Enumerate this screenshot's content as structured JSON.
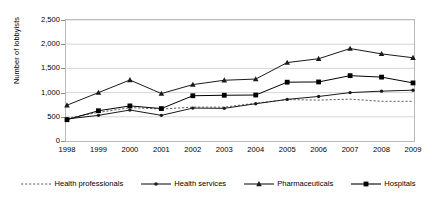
{
  "chart_data": {
    "type": "line",
    "title": "",
    "xlabel": "",
    "ylabel": "Number of lobbyists",
    "categories": [
      "1998",
      "1999",
      "2000",
      "2001",
      "2002",
      "2003",
      "2004",
      "2005",
      "2006",
      "2007",
      "2008",
      "2009"
    ],
    "ylim": [
      0,
      2500
    ],
    "yticks": [
      0,
      500,
      1000,
      1500,
      2000,
      2500
    ],
    "ytick_labels": [
      "0",
      "500",
      "1,000",
      "1,500",
      "2,000",
      "2,500"
    ],
    "grid": true,
    "grid_axis": "y",
    "legend_position": "bottom",
    "series": [
      {
        "name": "Health professionals",
        "marker": "none",
        "dash": true,
        "color": "#4d4d4d",
        "values": [
          470,
          590,
          690,
          660,
          700,
          700,
          780,
          855,
          845,
          865,
          820,
          820
        ]
      },
      {
        "name": "Health services",
        "marker": "diamond",
        "dash": false,
        "color": "#1a1a1a",
        "values": [
          455,
          530,
          640,
          530,
          680,
          675,
          770,
          860,
          920,
          1000,
          1030,
          1050
        ]
      },
      {
        "name": "Pharmaceuticals",
        "marker": "triangle",
        "dash": false,
        "color": "#1a1a1a",
        "values": [
          740,
          1000,
          1260,
          980,
          1165,
          1255,
          1280,
          1620,
          1700,
          1910,
          1800,
          1720
        ]
      },
      {
        "name": "Hospitals",
        "marker": "square",
        "dash": false,
        "color": "#000000",
        "values": [
          440,
          625,
          725,
          670,
          935,
          945,
          950,
          1215,
          1220,
          1350,
          1320,
          1200
        ]
      }
    ]
  },
  "legend": {
    "items": [
      {
        "label": "Health professionals"
      },
      {
        "label": "Health services"
      },
      {
        "label": "Pharmaceuticals"
      },
      {
        "label": "Hospitals"
      }
    ]
  }
}
